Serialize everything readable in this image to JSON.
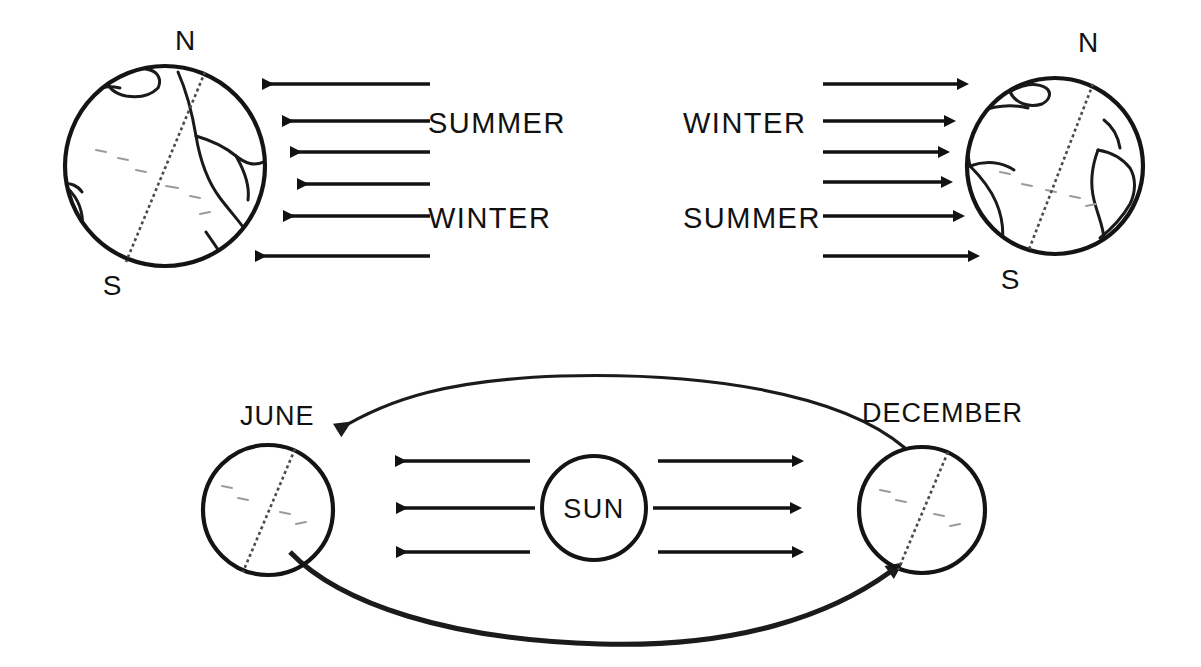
{
  "figure": {
    "title_text": "",
    "background_color": "#ffffff",
    "ink_color": "#121212"
  },
  "panels": {
    "top_left": {
      "name": "earth-northern-summer",
      "pole_north_label": "N",
      "pole_south_label": "S",
      "ray_direction": "right-to-left",
      "ray_count": 6,
      "labels": [
        {
          "text": "SUMMER",
          "hemisphere": "north",
          "x": 428,
          "y": 133
        },
        {
          "text": "WINTER",
          "hemisphere": "south",
          "x": 428,
          "y": 228
        }
      ]
    },
    "top_right": {
      "name": "earth-northern-winter",
      "pole_north_label": "N",
      "pole_south_label": "S",
      "ray_direction": "left-to-right",
      "ray_count": 6,
      "labels": [
        {
          "text": "WINTER",
          "hemisphere": "north",
          "x": 683,
          "y": 133
        },
        {
          "text": "SUMMER",
          "hemisphere": "south",
          "x": 683,
          "y": 228
        }
      ]
    },
    "bottom_orbit": {
      "name": "earth-orbit-around-sun",
      "sun_label": "SUN",
      "left_position_label": "JUNE",
      "right_position_label": "DECEMBER",
      "left_rays": 3,
      "right_rays": 3,
      "orbit_arrow_top": "points-left-toward-june",
      "orbit_arrow_bottom": "points-right-toward-december"
    }
  },
  "geometry": {
    "top_left_globe": {
      "cx": 165,
      "cy": 166,
      "r": 100
    },
    "top_right_globe": {
      "cx": 1055,
      "cy": 166,
      "r": 88
    },
    "june_globe": {
      "cx": 268,
      "cy": 510,
      "r": 65
    },
    "december_globe": {
      "cx": 922,
      "cy": 510,
      "r": 63
    },
    "sun_circle": {
      "cx": 594,
      "cy": 508,
      "r": 52
    }
  },
  "colors": {
    "ink": "#121212",
    "globe_stroke": "#141414",
    "axis_stroke": "#4a4a4a",
    "faint_stroke": "#9b9b9b"
  }
}
